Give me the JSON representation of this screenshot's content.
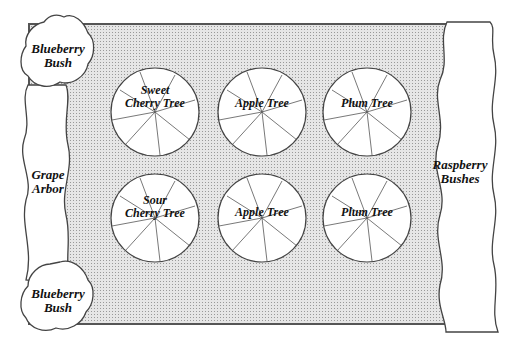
{
  "diagram": {
    "left_plants": [
      {
        "label_line1": "Blueberry",
        "label_line2": "Bush"
      },
      {
        "label_line1": "Grape",
        "label_line2": "Arbor"
      },
      {
        "label_line1": "Blueberry",
        "label_line2": "Bush"
      }
    ],
    "right_plants": [
      {
        "label_line1": "Raspberry",
        "label_line2": "Bushes"
      }
    ],
    "trees": [
      {
        "line1": "Sweet",
        "line2": "Cherry Tree"
      },
      {
        "line1": "",
        "line2": "Apple Tree"
      },
      {
        "line1": "",
        "line2": "Plum Tree"
      },
      {
        "line1": "Sour",
        "line2": "Cherry Tree"
      },
      {
        "line1": "",
        "line2": "Apple Tree"
      },
      {
        "line1": "",
        "line2": "Plum Tree"
      }
    ]
  }
}
